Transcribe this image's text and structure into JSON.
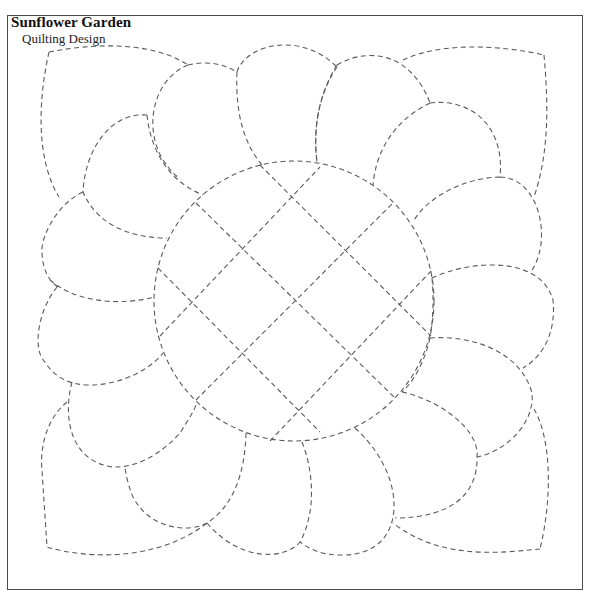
{
  "header": {
    "title": "Sunflower Garden",
    "subtitle": "Quilting Design"
  },
  "pattern": {
    "stroke_color": "#5a5a5a",
    "border_color": "#4a4a4a",
    "center_circle": {
      "cx": 294,
      "cy": 301,
      "r": 140
    },
    "grid_lines": [
      {
        "name": "grid-line-up-right-1",
        "d": "M160,336 L320,167"
      },
      {
        "name": "grid-line-up-right-2",
        "d": "M196,400 L393,203"
      },
      {
        "name": "grid-line-up-right-3",
        "d": "M270,441 L432,270"
      },
      {
        "name": "grid-line-down-right-1",
        "d": "M260,165 L431,336"
      },
      {
        "name": "grid-line-down-right-2",
        "d": "M196,203 L395,398"
      },
      {
        "name": "grid-line-down-right-3",
        "d": "M158,268 L320,432"
      }
    ],
    "petals": [
      {
        "name": "top-left-corner-leaf",
        "d": "M49,52 C90,44 150,40 188,65 M49,52 C38,100 36,160 59,197"
      },
      {
        "name": "petal-upper-left-1",
        "d": "M147,115 C110,112 85,150 83,192 C97,225 130,238 167,238 M147,115 C150,145 165,180 203,195"
      },
      {
        "name": "petal-upper-left-2",
        "d": "M188,65 C210,60 225,65 237,72 M188,65 C155,78 142,125 163,160 C170,170 175,176 180,178"
      },
      {
        "name": "petal-top-1",
        "d": "M237,72 C245,45 300,30 337,67 M237,72 C235,115 245,145 262,165 M337,67 C318,95 313,130 317,162"
      },
      {
        "name": "petal-top-2",
        "d": "M337,65 C365,48 410,50 430,103 M337,65 C318,95 313,130 317,162"
      },
      {
        "name": "top-right-corner-leaf",
        "d": "M403,60 C440,42 500,45 544,55 M544,55 C548,100 550,150 534,197"
      },
      {
        "name": "petal-right-1",
        "d": "M430,103 C470,98 505,125 500,177 M430,103 C395,120 376,150 373,185"
      },
      {
        "name": "petal-right-2",
        "d": "M500,177 C540,178 552,240 532,270 M500,177 C460,178 425,200 413,222"
      },
      {
        "name": "petal-right-3",
        "d": "M432,278 C470,260 540,255 553,300 C556,330 545,355 523,368 M432,278 C434,300 433,320 430,338"
      },
      {
        "name": "petal-right-4",
        "d": "M430,338 C470,335 520,350 532,393 C535,420 510,450 477,457 M430,338 C425,360 415,380 402,392"
      },
      {
        "name": "bottom-right-corner-leaf",
        "d": "M534,409 C552,440 552,500 540,549 M540,549 C500,553 440,560 393,523"
      },
      {
        "name": "petal-bottom-right-1",
        "d": "M402,392 C440,400 480,430 477,457 C478,495 450,518 395,518"
      },
      {
        "name": "petal-bottom-1",
        "d": "M355,428 C385,455 398,490 393,517 C388,545 365,556 340,555 C320,555 308,548 300,542"
      },
      {
        "name": "petal-bottom-2",
        "d": "M302,442 C315,475 315,515 300,542 C285,560 240,562 207,523"
      },
      {
        "name": "petal-bottom-3",
        "d": "M246,433 C245,470 235,505 207,523 C190,533 150,530 133,497 C128,485 126,475 125,467"
      },
      {
        "name": "bottom-left-corner-leaf",
        "d": "M67,402 C45,420 40,450 42,470 L47,547 C90,560 160,560 207,523"
      },
      {
        "name": "petal-left-1",
        "d": "M72,382 C62,420 72,462 113,467 C140,468 165,450 180,433 C188,420 195,410 197,402"
      },
      {
        "name": "petal-left-2",
        "d": "M57,287 C38,310 32,350 45,362 C55,378 70,385 90,385 C120,385 150,370 163,353"
      },
      {
        "name": "petal-left-3",
        "d": "M83,192 C55,205 40,240 42,253 C43,270 48,280 58,287 M50,280 C70,298 110,308 155,297"
      }
    ]
  }
}
